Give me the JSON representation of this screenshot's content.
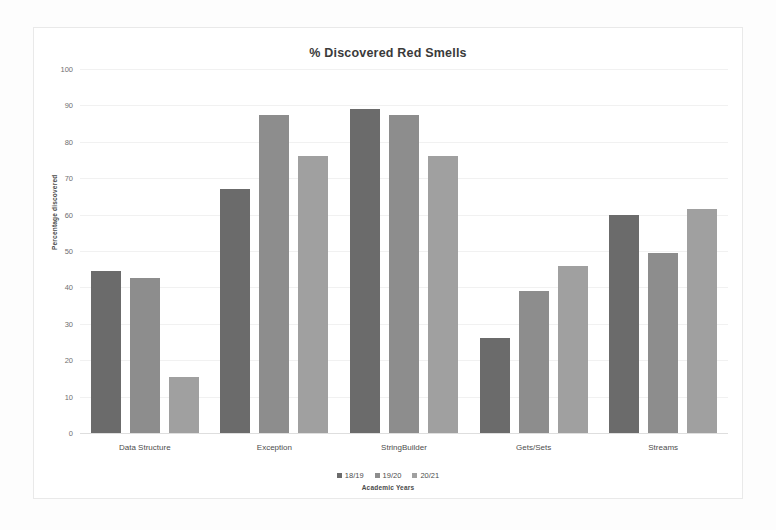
{
  "chart_data": {
    "type": "bar",
    "title": "% Discovered Red Smells",
    "xlabel": "Academic Years",
    "ylabel": "Percentage discovered",
    "categories": [
      "Data Structure",
      "Exception",
      "StringBuilder",
      "Gets/Sets",
      "Streams"
    ],
    "series": [
      {
        "name": "18/19",
        "color": "#6b6b6b",
        "values": [
          44.5,
          67,
          89,
          26,
          60
        ]
      },
      {
        "name": "19/20",
        "color": "#8d8d8d",
        "values": [
          42.5,
          87.5,
          87.5,
          39,
          49.5
        ]
      },
      {
        "name": "20/21",
        "color": "#a0a0a0",
        "values": [
          15.4,
          76,
          76,
          46,
          61.5
        ]
      }
    ],
    "ylim": [
      0,
      100
    ],
    "yticks": [
      0,
      10,
      20,
      30,
      40,
      50,
      60,
      70,
      80,
      90,
      100
    ],
    "ytick_labels": [
      "0",
      "10",
      "20",
      "30",
      "40",
      "50",
      "60",
      "70",
      "80",
      "90",
      "100"
    ],
    "grid": true,
    "legend_position": "bottom"
  }
}
